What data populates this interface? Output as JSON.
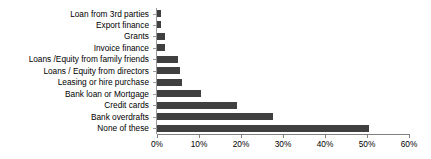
{
  "chart_data": {
    "type": "bar",
    "orientation": "horizontal",
    "title": "",
    "subtitle": "",
    "xlabel": "",
    "ylabel": "",
    "xlim": [
      0,
      60
    ],
    "xtick_labels": [
      "0%",
      "10%",
      "20%",
      "30%",
      "40%",
      "50%",
      "60%"
    ],
    "xtick_values": [
      0,
      10,
      20,
      30,
      40,
      50,
      60
    ],
    "grid": false,
    "legend": false,
    "units": "percent",
    "bar_color": "#404040",
    "axis_color": "#808080",
    "categories": [
      "Loan from 3rd parties",
      "Export finance",
      "Grants",
      "Invoice finance",
      "Loans /Equity from family friends",
      "Loans / Equity from directors",
      "Leasing or hire purchase",
      "Bank loan or Mortgage",
      "Credit cards",
      "Bank overdrafts",
      "None of these"
    ],
    "values": [
      1,
      1,
      2,
      2,
      5,
      5.5,
      6,
      10.5,
      19,
      27.5,
      50.5
    ]
  }
}
